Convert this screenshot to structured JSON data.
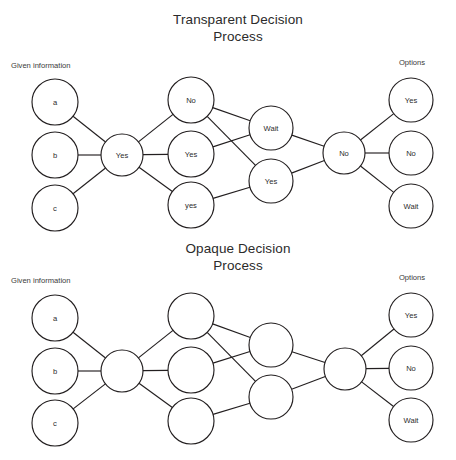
{
  "page": {
    "clipped_top_text": "",
    "background_color": "#ffffff",
    "stroke_color": "#231f20",
    "text_color": "#2b2b2b"
  },
  "diagrams": [
    {
      "id": "transparent",
      "title_line1": "Transparent Decision",
      "title_line2": "Process",
      "left_label": "Given information",
      "right_label": "Options",
      "nodes": [
        {
          "id": "t-in-a",
          "label": "a",
          "cx": 55,
          "cy": 102,
          "r": 23
        },
        {
          "id": "t-in-b",
          "label": "b",
          "cx": 55,
          "cy": 155,
          "r": 23
        },
        {
          "id": "t-in-c",
          "label": "c",
          "cx": 55,
          "cy": 208,
          "r": 23
        },
        {
          "id": "t-hub1",
          "label": "Yes",
          "cx": 122,
          "cy": 155,
          "r": 21
        },
        {
          "id": "t-mid-1",
          "label": "No",
          "cx": 191,
          "cy": 100,
          "r": 23
        },
        {
          "id": "t-mid-2",
          "label": "Yes",
          "cx": 191,
          "cy": 154,
          "r": 23
        },
        {
          "id": "t-mid-3",
          "label": "yes",
          "cx": 191,
          "cy": 205,
          "r": 23
        },
        {
          "id": "t-mid2-1",
          "label": "Wait",
          "cx": 271,
          "cy": 128,
          "r": 22
        },
        {
          "id": "t-mid2-2",
          "label": "Yes",
          "cx": 271,
          "cy": 181,
          "r": 22
        },
        {
          "id": "t-hub2",
          "label": "No",
          "cx": 344,
          "cy": 153,
          "r": 21
        },
        {
          "id": "t-out-1",
          "label": "Yes",
          "cx": 411,
          "cy": 100,
          "r": 22
        },
        {
          "id": "t-out-2",
          "label": "No",
          "cx": 411,
          "cy": 153,
          "r": 22
        },
        {
          "id": "t-out-3",
          "label": "Wait",
          "cx": 411,
          "cy": 206,
          "r": 22
        }
      ],
      "edges": [
        [
          "t-in-a",
          "t-hub1"
        ],
        [
          "t-in-b",
          "t-hub1"
        ],
        [
          "t-in-c",
          "t-hub1"
        ],
        [
          "t-hub1",
          "t-mid-1"
        ],
        [
          "t-hub1",
          "t-mid-2"
        ],
        [
          "t-hub1",
          "t-mid-3"
        ],
        [
          "t-mid-1",
          "t-mid2-1"
        ],
        [
          "t-mid-1",
          "t-mid2-2"
        ],
        [
          "t-mid-2",
          "t-mid2-1"
        ],
        [
          "t-mid-3",
          "t-mid2-2"
        ],
        [
          "t-mid2-1",
          "t-hub2"
        ],
        [
          "t-mid2-2",
          "t-hub2"
        ],
        [
          "t-hub2",
          "t-out-1"
        ],
        [
          "t-hub2",
          "t-out-2"
        ],
        [
          "t-hub2",
          "t-out-3"
        ]
      ]
    },
    {
      "id": "opaque",
      "title_line1": "Opaque Decision",
      "title_line2": "Process",
      "left_label": "Given information",
      "right_label": "Options",
      "nodes": [
        {
          "id": "o-in-a",
          "label": "a",
          "cx": 55,
          "cy": 318,
          "r": 23
        },
        {
          "id": "o-in-b",
          "label": "b",
          "cx": 55,
          "cy": 371,
          "r": 23
        },
        {
          "id": "o-in-c",
          "label": "c",
          "cx": 55,
          "cy": 423,
          "r": 23
        },
        {
          "id": "o-hub1",
          "label": "",
          "cx": 122,
          "cy": 371,
          "r": 21
        },
        {
          "id": "o-mid-1",
          "label": "",
          "cx": 191,
          "cy": 316,
          "r": 23
        },
        {
          "id": "o-mid-2",
          "label": "",
          "cx": 191,
          "cy": 370,
          "r": 23
        },
        {
          "id": "o-mid-3",
          "label": "",
          "cx": 191,
          "cy": 421,
          "r": 23
        },
        {
          "id": "o-mid2-1",
          "label": "",
          "cx": 271,
          "cy": 345,
          "r": 22
        },
        {
          "id": "o-mid2-2",
          "label": "",
          "cx": 271,
          "cy": 397,
          "r": 22
        },
        {
          "id": "o-hub2",
          "label": "",
          "cx": 345,
          "cy": 369,
          "r": 21
        },
        {
          "id": "o-out-1",
          "label": "Yes",
          "cx": 411,
          "cy": 315,
          "r": 22
        },
        {
          "id": "o-out-2",
          "label": "No",
          "cx": 411,
          "cy": 368,
          "r": 22
        },
        {
          "id": "o-out-3",
          "label": "Wait",
          "cx": 411,
          "cy": 420,
          "r": 22
        }
      ],
      "edges": [
        [
          "o-in-a",
          "o-hub1"
        ],
        [
          "o-in-b",
          "o-hub1"
        ],
        [
          "o-in-c",
          "o-hub1"
        ],
        [
          "o-hub1",
          "o-mid-1"
        ],
        [
          "o-hub1",
          "o-mid-2"
        ],
        [
          "o-hub1",
          "o-mid-3"
        ],
        [
          "o-mid-1",
          "o-mid2-1"
        ],
        [
          "o-mid-1",
          "o-mid2-2"
        ],
        [
          "o-mid-2",
          "o-mid2-1"
        ],
        [
          "o-mid-3",
          "o-mid2-2"
        ],
        [
          "o-mid2-1",
          "o-hub2"
        ],
        [
          "o-mid2-2",
          "o-hub2"
        ],
        [
          "o-hub2",
          "o-out-1"
        ],
        [
          "o-hub2",
          "o-out-2"
        ],
        [
          "o-hub2",
          "o-out-3"
        ]
      ]
    }
  ],
  "layout": {
    "titles": [
      {
        "x": 238,
        "y": 24,
        "y2": 41
      },
      {
        "x": 238,
        "y": 253,
        "y2": 270
      }
    ],
    "left_labels": [
      {
        "x": 11,
        "y": 68
      },
      {
        "x": 11,
        "y": 283
      }
    ],
    "right_labels": [
      {
        "x": 412,
        "y": 65
      },
      {
        "x": 412,
        "y": 280
      }
    ]
  }
}
